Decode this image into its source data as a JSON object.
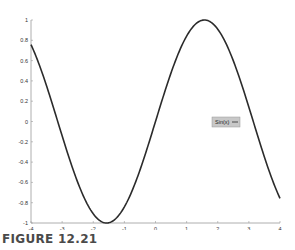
{
  "caption": "FIGURE 12.21",
  "colors": {
    "curve": "#2b2b2b",
    "axis": "#9a9a9a",
    "legend_bg": "#c8c8c8",
    "caption": "#4a4a4a"
  },
  "chart_data": {
    "type": "line",
    "title": "",
    "xlabel": "",
    "ylabel": "",
    "xlim": [
      -4,
      4
    ],
    "ylim": [
      -1,
      1
    ],
    "grid": false,
    "legend_position": "inside-right",
    "x_ticks": [
      "-4",
      "-3",
      "-2",
      "-1",
      "0",
      "1",
      "2",
      "3",
      "4"
    ],
    "y_ticks": [
      "-1",
      "-0.8",
      "-0.6",
      "-0.4",
      "-0.2",
      "0",
      "0.2",
      "0.4",
      "0.6",
      "0.8",
      "1"
    ],
    "series": [
      {
        "name": "Sin(x)",
        "function": "sin(x)",
        "x": [
          -4,
          -3.5,
          -3,
          -2.5,
          -2,
          -1.5708,
          -1.5,
          -1,
          -0.5,
          0,
          0.5,
          1,
          1.5,
          1.5708,
          2,
          2.5,
          3,
          3.5,
          4
        ],
        "y": [
          0.757,
          0.351,
          -0.141,
          -0.598,
          -0.909,
          -1.0,
          -0.997,
          -0.841,
          -0.479,
          0.0,
          0.479,
          0.841,
          0.997,
          1.0,
          0.909,
          0.598,
          0.141,
          -0.351,
          -0.757
        ]
      }
    ],
    "legend": [
      {
        "label": "Sin(x)",
        "marker": "line"
      }
    ]
  }
}
